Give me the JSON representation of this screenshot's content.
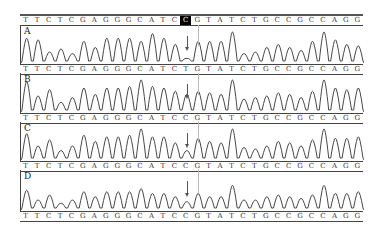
{
  "figure": {
    "bases": [
      "T",
      "T",
      "C",
      "T",
      "C",
      "G",
      "A",
      "G",
      "G",
      "G",
      "C",
      "A",
      "T",
      "C",
      "C",
      "G",
      "T",
      "A",
      "T",
      "C",
      "T",
      "G",
      "C",
      "C",
      "G",
      "C",
      "C",
      "A",
      "G",
      "G"
    ],
    "highlight_index": 14,
    "header_sequence": "TTCTCGAGGGCATC[C]GTATCTGCCGCCAGG",
    "panels": [
      {
        "label": "A",
        "sequence_below": "TTCTCGAGGGCATCTGTATCTGCCGCCAGG",
        "variant_base": "C/T"
      },
      {
        "label": "B",
        "sequence_below": "TTCTCGAGGGCATCCGTATCTGCCGCCAGG",
        "variant_base": "T"
      },
      {
        "label": "C",
        "sequence_below": "TTCTCGAGGGCATCCGTATCTGCCGCCAGG",
        "variant_base": "C"
      },
      {
        "label": "D",
        "sequence_below": "TTCTCGAGGGCATCCGTATCTGCCGCCAGG",
        "variant_base": "C"
      }
    ],
    "row_sequences": [
      [
        "T",
        "T",
        "C",
        "T",
        "C",
        "G",
        "A",
        "G",
        "G",
        "G",
        "C",
        "A",
        "T",
        "C",
        "C",
        "G",
        "T",
        "A",
        "T",
        "C",
        "T",
        "G",
        "C",
        "C",
        "G",
        "C",
        "C",
        "A",
        "G",
        "G"
      ],
      [
        "T",
        "T",
        "C",
        "T",
        "C",
        "G",
        "A",
        "G",
        "G",
        "G",
        "C",
        "A",
        "T",
        "C",
        "T",
        "G",
        "T",
        "A",
        "T",
        "C",
        "T",
        "G",
        "C",
        "C",
        "G",
        "C",
        "C",
        "A",
        "G",
        "G"
      ],
      [
        "T",
        "T",
        "C",
        "T",
        "C",
        "G",
        "A",
        "G",
        "G",
        "G",
        "C",
        "A",
        "T",
        "C",
        "C",
        "G",
        "T",
        "A",
        "T",
        "C",
        "T",
        "G",
        "C",
        "C",
        "G",
        "C",
        "C",
        "A",
        "G",
        "G"
      ],
      [
        "T",
        "T",
        "C",
        "T",
        "C",
        "G",
        "A",
        "G",
        "G",
        "G",
        "C",
        "A",
        "T",
        "C",
        "C",
        "G",
        "T",
        "A",
        "T",
        "C",
        "T",
        "G",
        "C",
        "C",
        "G",
        "C",
        "C",
        "A",
        "G",
        "G"
      ],
      [
        "T",
        "T",
        "C",
        "T",
        "C",
        "G",
        "A",
        "G",
        "G",
        "G",
        "C",
        "A",
        "T",
        "C",
        "C",
        "G",
        "T",
        "A",
        "T",
        "C",
        "T",
        "G",
        "C",
        "C",
        "G",
        "C",
        "C",
        "A",
        "G",
        "G"
      ]
    ],
    "peak_heights": {
      "A": [
        0.8,
        0.75,
        0.35,
        0.45,
        0.3,
        0.7,
        0.5,
        0.8,
        0.8,
        0.8,
        0.7,
        0.95,
        0.8,
        0.6,
        0.15,
        0.7,
        0.7,
        0.7,
        1.0,
        0.3,
        0.35,
        0.5,
        0.6,
        0.5,
        0.4,
        0.7,
        1.0,
        0.75,
        0.6,
        0.55
      ],
      "B": [
        0.95,
        0.5,
        0.7,
        0.3,
        0.45,
        0.75,
        0.55,
        0.75,
        0.75,
        0.8,
        1.0,
        0.8,
        0.75,
        0.65,
        0.55,
        0.65,
        0.6,
        0.55,
        1.0,
        0.4,
        0.45,
        0.5,
        0.6,
        0.55,
        0.45,
        0.65,
        1.0,
        0.75,
        0.7,
        0.75
      ],
      "C": [
        0.85,
        0.45,
        0.65,
        0.3,
        0.45,
        0.8,
        0.6,
        0.75,
        0.75,
        0.8,
        1.0,
        0.75,
        0.75,
        0.55,
        0.3,
        0.7,
        0.6,
        0.55,
        1.0,
        0.4,
        0.35,
        0.45,
        0.6,
        0.55,
        0.45,
        0.65,
        1.0,
        0.7,
        0.7,
        0.75
      ],
      "D": [
        0.6,
        0.3,
        0.45,
        0.2,
        0.3,
        0.55,
        0.4,
        0.55,
        0.55,
        0.55,
        0.65,
        0.5,
        0.5,
        0.4,
        0.25,
        0.5,
        0.4,
        0.4,
        0.75,
        0.3,
        0.3,
        0.4,
        0.45,
        0.4,
        0.35,
        0.45,
        0.75,
        0.5,
        0.5,
        0.55
      ]
    }
  }
}
